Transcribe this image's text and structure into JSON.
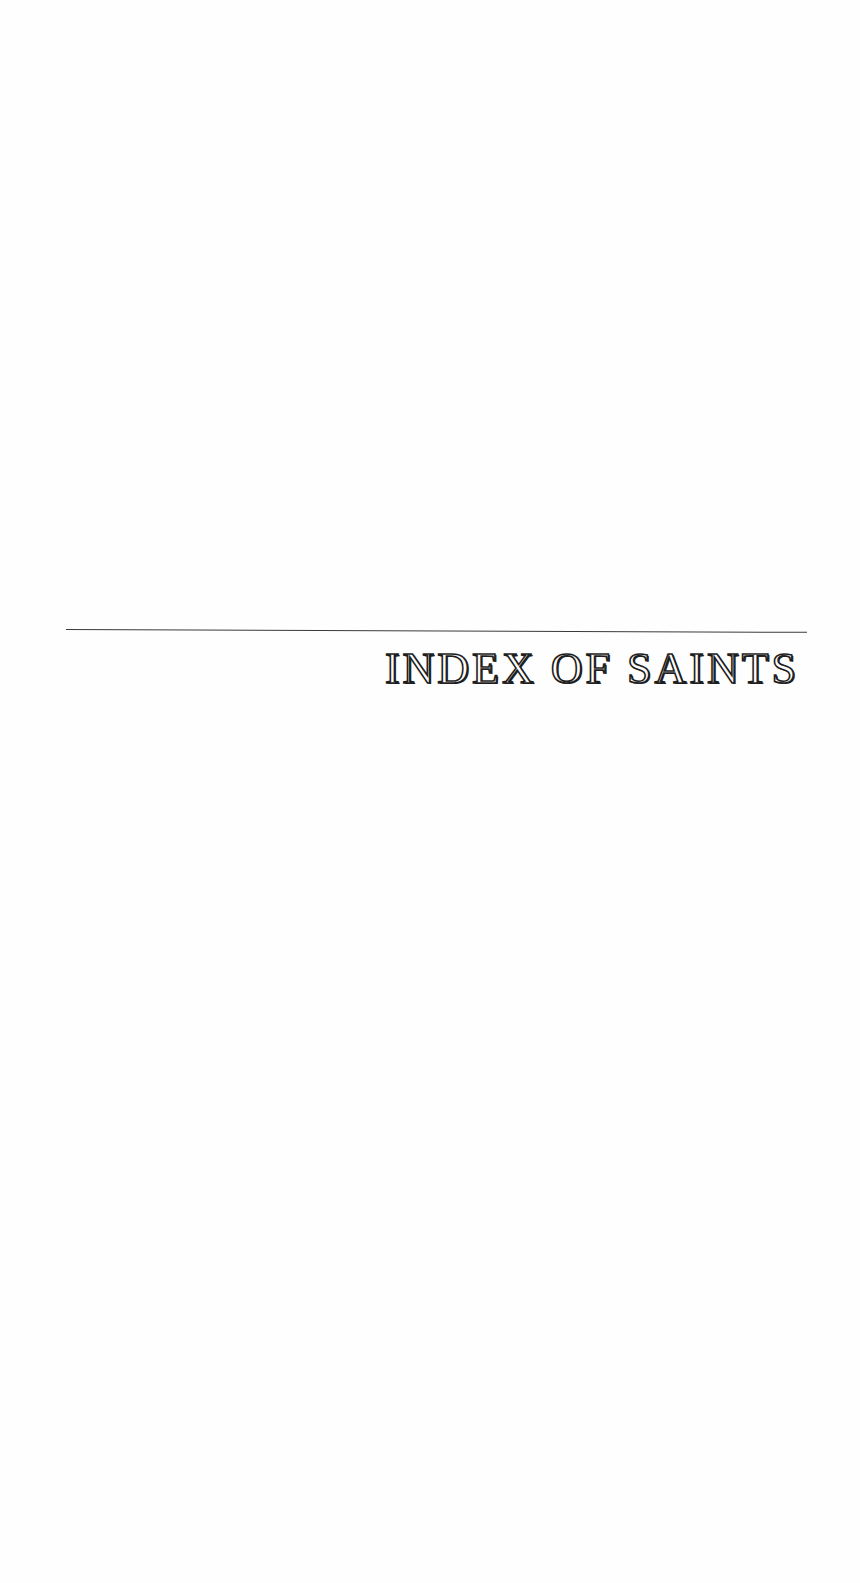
{
  "page": {
    "title": "INDEX OF SAINTS",
    "colors": {
      "background": "#fefefe",
      "ink": "#1e1e1e",
      "rule": "#3a3a3a"
    }
  }
}
